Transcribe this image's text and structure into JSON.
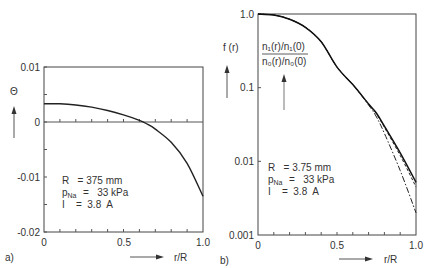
{
  "chart_data": [
    {
      "panel": "a)",
      "type": "line",
      "ylabel": "Θ",
      "xlabel": "r/R",
      "xlim": [
        0,
        1.0
      ],
      "ylim": [
        -0.02,
        0.01
      ],
      "x_ticks": [
        "0",
        "0.5",
        "1.0"
      ],
      "y_ticks": [
        "0.01",
        "0",
        "-0.01",
        "-0.02"
      ],
      "grid": false,
      "zero_line": true,
      "series": [
        {
          "name": "Θ(r)",
          "style": "solid",
          "x": [
            0,
            0.1,
            0.2,
            0.3,
            0.4,
            0.5,
            0.6,
            0.65,
            0.7,
            0.8,
            0.9,
            1.0
          ],
          "y": [
            0.0033,
            0.0033,
            0.0031,
            0.0027,
            0.0021,
            0.0013,
            0.0003,
            -0.0004,
            -0.0013,
            -0.0037,
            -0.0075,
            -0.0135
          ]
        }
      ],
      "annotations": {
        "R": "R   = 375 mm",
        "p_label": "p",
        "p_sub": "Na",
        "p_value": "=   33 kPa",
        "I": "I    =  3.8  A"
      }
    },
    {
      "panel": "b)",
      "type": "line",
      "yscale": "log",
      "ylabel": "f (r)",
      "curve_label_num": "n₁(r)/n₁(0)",
      "curve_label_den": "n₀(r)/n₀(0)",
      "xlabel": "r/R",
      "xlim": [
        0,
        1.0
      ],
      "ylim": [
        0.001,
        1.0
      ],
      "x_ticks": [
        "0",
        "0.5",
        "1.0"
      ],
      "y_ticks": [
        "1.0",
        "0.1",
        "0.01",
        "0.001"
      ],
      "grid": false,
      "series": [
        {
          "name": "f(r)",
          "style": "solid",
          "x": [
            0,
            0.1,
            0.2,
            0.3,
            0.4,
            0.5,
            0.6,
            0.7,
            0.75,
            0.8,
            0.9,
            1.0
          ],
          "y": [
            1.0,
            0.97,
            0.85,
            0.66,
            0.42,
            0.19,
            0.11,
            0.06,
            0.045,
            0.03,
            0.013,
            0.0052
          ]
        },
        {
          "name": "n1(r)/n1(0)",
          "style": "dashed",
          "x": [
            0,
            0.1,
            0.2,
            0.3,
            0.4,
            0.5,
            0.6,
            0.7,
            0.75,
            0.8,
            0.9,
            1.0
          ],
          "y": [
            1.0,
            0.97,
            0.85,
            0.66,
            0.42,
            0.19,
            0.11,
            0.06,
            0.044,
            0.029,
            0.012,
            0.0045
          ]
        },
        {
          "name": "n0(r)/n0(0)",
          "style": "dash-dot",
          "x": [
            0,
            0.1,
            0.2,
            0.3,
            0.4,
            0.5,
            0.6,
            0.7,
            0.75,
            0.8,
            0.9,
            1.0
          ],
          "y": [
            1.0,
            0.97,
            0.85,
            0.66,
            0.42,
            0.19,
            0.11,
            0.058,
            0.04,
            0.024,
            0.0075,
            0.002
          ]
        }
      ],
      "annotations": {
        "R": "R   = 3.75 mm",
        "p_label": "p",
        "p_sub": "Na",
        "p_value": "=   33 kPa",
        "I": "I    =  3.8  A"
      }
    }
  ]
}
